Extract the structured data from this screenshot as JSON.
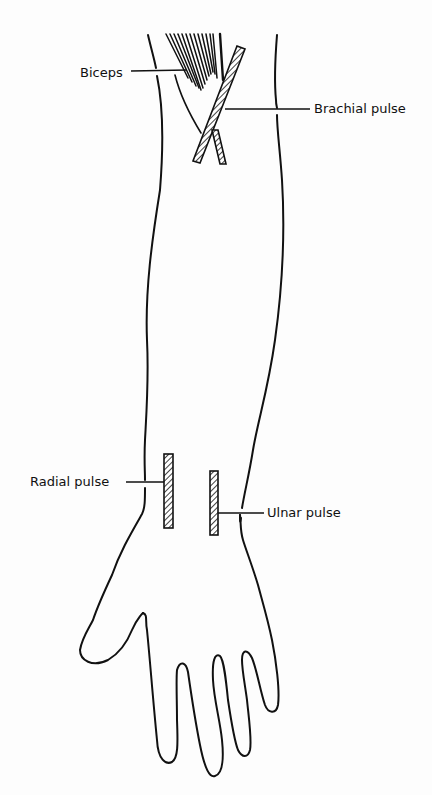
{
  "diagram": {
    "labels": [
      {
        "id": "biceps",
        "text": "Biceps"
      },
      {
        "id": "brachial",
        "text": "Brachial pulse"
      },
      {
        "id": "radial",
        "text": "Radial pulse"
      },
      {
        "id": "ulnar",
        "text": "Ulnar pulse"
      }
    ],
    "colors": {
      "line": "#111111",
      "background": "#fdfdfd"
    }
  }
}
